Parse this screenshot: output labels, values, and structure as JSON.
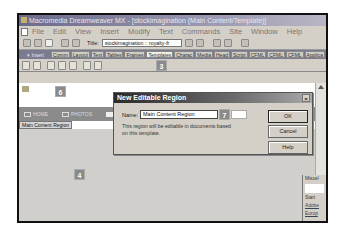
{
  "window": {
    "title": "Macromedia Dreamweaver MX - [stockimagination (Main Content/Template)]"
  },
  "menubar": {
    "items": [
      "File",
      "Edit",
      "View",
      "Insert",
      "Modify",
      "Text",
      "Commands",
      "Site",
      "Window",
      "Help"
    ]
  },
  "toolbar": {
    "title_label": "Title:",
    "title_value": "stockimagination :: royalty-fr"
  },
  "insertbar": {
    "label": "▾ Insert",
    "tabs": [
      "Comm",
      "Layout",
      "Text",
      "Tables",
      "Frames",
      "Templates",
      "Charac",
      "Media",
      "Head",
      "Script",
      "CFML",
      "CFML",
      "CFML",
      "Applica"
    ],
    "active_tab": "Templates"
  },
  "callouts": {
    "step3": "3",
    "step4": "4",
    "step6": "6",
    "step7": "7"
  },
  "design": {
    "nav_items": [
      "HOME",
      "PHOTOS"
    ],
    "region_label": "Main Content Region"
  },
  "dialog": {
    "title": "New Editable Region",
    "close": "×",
    "name_label": "Name:",
    "name_value": "Main Content Region",
    "description": "This region will be editable in documents based on this template.",
    "buttons": {
      "ok": "OK",
      "cancel": "Cancel",
      "help": "Help"
    }
  },
  "side_panel": {
    "items": [
      "Miscel",
      "Start",
      "Adobe",
      "Europ"
    ]
  }
}
